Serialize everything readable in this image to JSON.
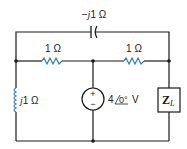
{
  "circuit": {
    "capacitor": {
      "label": "−j1 Ω",
      "prefix": "−",
      "j": "j",
      "value": "1 Ω"
    },
    "resistor_left": {
      "label": "1 Ω"
    },
    "resistor_right": {
      "label": "1 Ω"
    },
    "inductor": {
      "label": "j1 Ω",
      "j": "j",
      "value": "1 Ω"
    },
    "source": {
      "label": "4∠0° V",
      "magnitude": "4",
      "angle": "0°",
      "unit": "V",
      "plus": "+",
      "minus": "−"
    },
    "load": {
      "label": "Z_L",
      "main": "Z",
      "sub": "L"
    },
    "colors": {
      "wire": "#1a1a1a",
      "component": "#2a7fc0",
      "text": "#222222"
    }
  }
}
